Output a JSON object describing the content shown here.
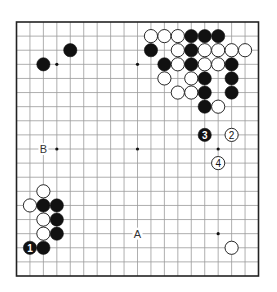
{
  "diagram": {
    "type": "go-board",
    "size": 19,
    "colors": {
      "background": "#ffffff",
      "line": "#9a9a9a",
      "border": "#222222",
      "black": "#111111",
      "white": "#ffffff"
    },
    "hoshi": [
      [
        3,
        3
      ],
      [
        9,
        3
      ],
      [
        15,
        3
      ],
      [
        3,
        9
      ],
      [
        9,
        9
      ],
      [
        15,
        9
      ],
      [
        3,
        15
      ],
      [
        9,
        15
      ],
      [
        15,
        15
      ]
    ],
    "stones": [
      {
        "color": "black",
        "col": 4,
        "row": 2
      },
      {
        "color": "black",
        "col": 2,
        "row": 3
      },
      {
        "color": "white",
        "col": 10,
        "row": 1
      },
      {
        "color": "white",
        "col": 11,
        "row": 1
      },
      {
        "color": "white",
        "col": 12,
        "row": 1
      },
      {
        "color": "black",
        "col": 13,
        "row": 1
      },
      {
        "color": "black",
        "col": 14,
        "row": 1
      },
      {
        "color": "black",
        "col": 15,
        "row": 1
      },
      {
        "color": "black",
        "col": 10,
        "row": 2
      },
      {
        "color": "white",
        "col": 12,
        "row": 2
      },
      {
        "color": "black",
        "col": 13,
        "row": 2
      },
      {
        "color": "white",
        "col": 14,
        "row": 2
      },
      {
        "color": "white",
        "col": 15,
        "row": 2
      },
      {
        "color": "white",
        "col": 16,
        "row": 2
      },
      {
        "color": "white",
        "col": 17,
        "row": 2
      },
      {
        "color": "black",
        "col": 11,
        "row": 3
      },
      {
        "color": "white",
        "col": 12,
        "row": 3
      },
      {
        "color": "black",
        "col": 13,
        "row": 3
      },
      {
        "color": "white",
        "col": 14,
        "row": 3
      },
      {
        "color": "white",
        "col": 15,
        "row": 3
      },
      {
        "color": "black",
        "col": 16,
        "row": 3
      },
      {
        "color": "white",
        "col": 11,
        "row": 4
      },
      {
        "color": "white",
        "col": 13,
        "row": 4
      },
      {
        "color": "black",
        "col": 14,
        "row": 4
      },
      {
        "color": "black",
        "col": 16,
        "row": 4
      },
      {
        "color": "white",
        "col": 12,
        "row": 5
      },
      {
        "color": "white",
        "col": 13,
        "row": 5
      },
      {
        "color": "black",
        "col": 14,
        "row": 5
      },
      {
        "color": "black",
        "col": 16,
        "row": 5
      },
      {
        "color": "black",
        "col": 14,
        "row": 6
      },
      {
        "color": "white",
        "col": 15,
        "row": 6
      },
      {
        "color": "black",
        "col": 14,
        "row": 8,
        "label": "3"
      },
      {
        "color": "white",
        "col": 16,
        "row": 8,
        "label": "2"
      },
      {
        "color": "white",
        "col": 15,
        "row": 10,
        "label": "4"
      },
      {
        "color": "white",
        "col": 2,
        "row": 12
      },
      {
        "color": "white",
        "col": 1,
        "row": 13
      },
      {
        "color": "black",
        "col": 2,
        "row": 13
      },
      {
        "color": "black",
        "col": 3,
        "row": 13
      },
      {
        "color": "white",
        "col": 2,
        "row": 14
      },
      {
        "color": "black",
        "col": 3,
        "row": 14
      },
      {
        "color": "white",
        "col": 2,
        "row": 15
      },
      {
        "color": "black",
        "col": 3,
        "row": 15
      },
      {
        "color": "black",
        "col": 1,
        "row": 16,
        "label": "1"
      },
      {
        "color": "black",
        "col": 2,
        "row": 16
      },
      {
        "color": "white",
        "col": 16,
        "row": 16
      }
    ],
    "markers": [
      {
        "text": "A",
        "col": 9,
        "row": 15
      },
      {
        "text": "B",
        "col": 2,
        "row": 9
      }
    ]
  }
}
